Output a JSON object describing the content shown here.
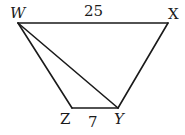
{
  "figure": {
    "type": "trapezoid",
    "vertices": {
      "W": {
        "label": "W",
        "x": 18,
        "y": 23
      },
      "X": {
        "label": "X",
        "x": 168,
        "y": 23
      },
      "Y": {
        "label": "Y",
        "x": 118,
        "y": 108
      },
      "Z": {
        "label": "Z",
        "x": 72,
        "y": 108
      }
    },
    "segments": [
      {
        "from": "W",
        "to": "X",
        "label": "25"
      },
      {
        "from": "X",
        "to": "Y",
        "label": ""
      },
      {
        "from": "Y",
        "to": "Z",
        "label": "7"
      },
      {
        "from": "Z",
        "to": "W",
        "label": ""
      },
      {
        "from": "W",
        "to": "Y",
        "label": "",
        "diagonal": true
      }
    ],
    "labels": {
      "W": "W",
      "X": "X",
      "Y": "Y",
      "Z": "Z",
      "WX_length": "25",
      "ZY_length": "7"
    }
  }
}
